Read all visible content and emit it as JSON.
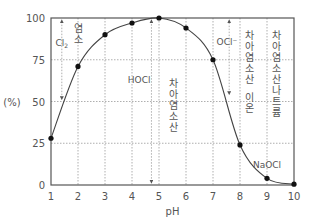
{
  "chart_data": {
    "type": "line",
    "title": "",
    "xlabel": "pH",
    "ylabel": "(%)",
    "xlim": [
      1,
      10
    ],
    "ylim": [
      0,
      100
    ],
    "x_ticks": [
      1,
      2,
      3,
      4,
      5,
      6,
      7,
      8,
      9,
      10
    ],
    "y_ticks": [
      0,
      25,
      50,
      75,
      100
    ],
    "grid": true,
    "series": [
      {
        "name": "HOCl",
        "x": [
          1,
          2,
          3,
          4,
          5,
          6,
          7,
          8,
          9,
          10
        ],
        "values": [
          28,
          71,
          90,
          97,
          100,
          94,
          75,
          24,
          4,
          0.5
        ]
      }
    ],
    "annotations": [
      {
        "id": "cl2",
        "text": "Cl2",
        "sub": "2",
        "kind": "species",
        "x": 1.4,
        "y_from": 98,
        "y_to": 52,
        "label_y": 83
      },
      {
        "id": "hocl",
        "text": "HOCl",
        "kind": "species",
        "x": 4.72,
        "y_from": 98,
        "y_to": 2,
        "label_y": 61
      },
      {
        "id": "ocl",
        "text": "OCl⁻",
        "kind": "species",
        "x": 7.6,
        "y_from": 98,
        "y_to": 55,
        "label_y": 84
      }
    ],
    "vertical_labels": [
      {
        "id": "chlorine",
        "text": "염소",
        "x": 2.0,
        "y_top": 97
      },
      {
        "id": "hypochlorous-acid",
        "text": "차아염소산",
        "x": 5.55,
        "y_top": 64
      },
      {
        "id": "hypochlorite-ion",
        "text": "차아염소산 이온",
        "x": 8.35,
        "y_top": 93
      },
      {
        "id": "sodium-hypochlorite",
        "text": "차아염소산나트륨",
        "x": 9.35,
        "y_top": 93
      }
    ],
    "point_labels": [
      {
        "id": "naocl",
        "text": "NaOCl",
        "x": 9.0,
        "y": 10
      }
    ]
  },
  "colors": {
    "axis": "#555555",
    "grid": "#9a9a9a",
    "line": "#444444",
    "marker": "#111111",
    "text": "#555555"
  }
}
